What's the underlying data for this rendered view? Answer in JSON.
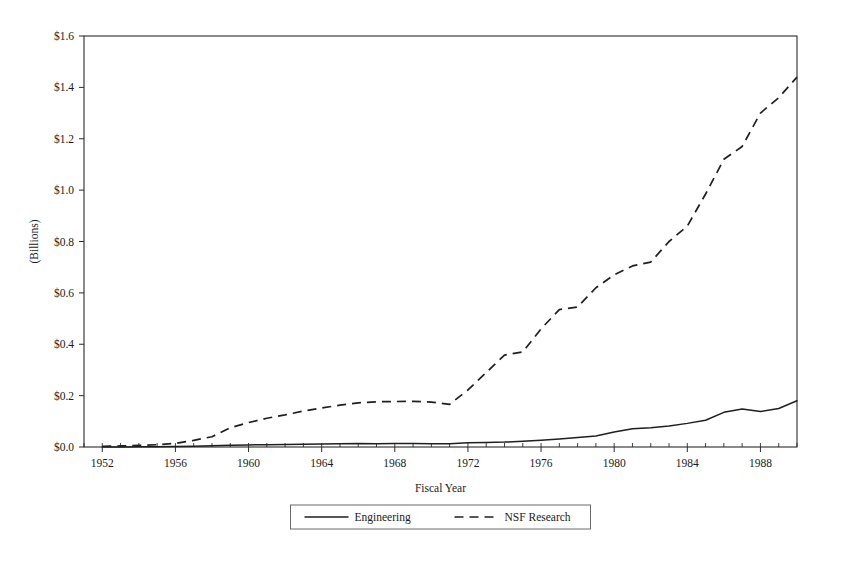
{
  "chart_data": {
    "type": "line",
    "title": "",
    "xlabel": "Fiscal Year",
    "ylabel": "(Billions)",
    "xlim": [
      1951,
      1990
    ],
    "ylim": [
      0.0,
      1.6
    ],
    "grid": false,
    "legend_position": "bottom-center",
    "y_tick_labels": [
      "$0.0",
      "$0.2",
      "$0.4",
      "$0.6",
      "$0.8",
      "$1.0",
      "$1.2",
      "$1.4",
      "$1.6"
    ],
    "y_tick_values": [
      0.0,
      0.2,
      0.4,
      0.6,
      0.8,
      1.0,
      1.2,
      1.4,
      1.6
    ],
    "x_tick_labels": [
      "1952",
      "1956",
      "1960",
      "1964",
      "1968",
      "1972",
      "1976",
      "1980",
      "1984",
      "1988"
    ],
    "x_tick_values": [
      1952,
      1956,
      1960,
      1964,
      1968,
      1972,
      1976,
      1980,
      1984,
      1988
    ],
    "x_minor_step": 1,
    "x": [
      1952,
      1953,
      1954,
      1955,
      1956,
      1957,
      1958,
      1959,
      1960,
      1961,
      1962,
      1963,
      1964,
      1965,
      1966,
      1967,
      1968,
      1969,
      1970,
      1971,
      1972,
      1973,
      1974,
      1975,
      1976,
      1977,
      1978,
      1979,
      1980,
      1981,
      1982,
      1983,
      1984,
      1985,
      1986,
      1987,
      1988,
      1989
    ],
    "series": [
      {
        "name": "Engineering",
        "style": "solid",
        "color": "#1f1f1f",
        "values": [
          0.0,
          0.0,
          0.001,
          0.001,
          0.002,
          0.003,
          0.005,
          0.007,
          0.008,
          0.009,
          0.01,
          0.011,
          0.012,
          0.013,
          0.014,
          0.013,
          0.014,
          0.014,
          0.013,
          0.013,
          0.017,
          0.018,
          0.019,
          0.022,
          0.026,
          0.031,
          0.037,
          0.043,
          0.058,
          0.071,
          0.075,
          0.082,
          0.092,
          0.104,
          0.135,
          0.148,
          0.138,
          0.15
        ]
      },
      {
        "name": "NSF Research",
        "style": "dashed",
        "color": "#1f1f1f",
        "values": [
          0.003,
          0.004,
          0.006,
          0.009,
          0.014,
          0.026,
          0.04,
          0.075,
          0.095,
          0.112,
          0.125,
          0.14,
          0.152,
          0.163,
          0.172,
          0.176,
          0.177,
          0.178,
          0.175,
          0.166,
          0.222,
          0.29,
          0.358,
          0.37,
          0.46,
          0.535,
          0.545,
          0.62,
          0.67,
          0.705,
          0.72,
          0.8,
          0.86,
          0.985,
          1.12,
          1.17,
          1.3,
          1.36
        ]
      }
    ],
    "last_point": {
      "year": 1990,
      "engineering": 0.18,
      "nsf_research": 1.44
    },
    "legend": [
      {
        "label": "Engineering",
        "style": "solid"
      },
      {
        "label": "NSF Research",
        "style": "dashed"
      }
    ]
  },
  "figure": {
    "width": 843,
    "height": 568,
    "background": "#ffffff",
    "axis_color": "#2b2b2b",
    "line_color": "#1f1f1f"
  }
}
